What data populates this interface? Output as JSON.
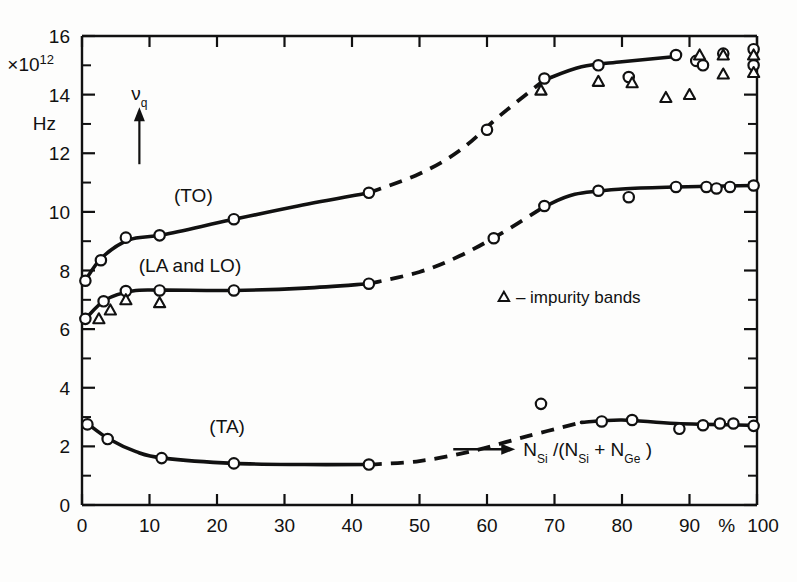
{
  "chart_data": {
    "type": "scatter",
    "title": "",
    "subtitle": "",
    "xlabel": "N_Si /(N_Si + N_Ge)",
    "xlabel_parts": {
      "arrow": "→",
      "n1": "N",
      "sub1": "Si",
      "slash": " /(",
      "n2": "N",
      "sub2": "Si",
      "plus": " + ",
      "n3": "N",
      "sub3": "Ge",
      "close": " )"
    },
    "ylabel": "Hz",
    "y_exponent_label": "×10",
    "y_exponent_sup": "12",
    "y_unit": "Hz",
    "xlim": [
      0,
      100
    ],
    "ylim": [
      0,
      16
    ],
    "x_unit": "%",
    "x_ticks": [
      0,
      10,
      20,
      30,
      40,
      50,
      60,
      70,
      80,
      90,
      100
    ],
    "x_ticklabels": [
      "0",
      "10",
      "20",
      "30",
      "40",
      "50",
      "60",
      "70",
      "80",
      "90",
      "100"
    ],
    "y_ticks": [
      0,
      2,
      4,
      6,
      8,
      10,
      12,
      14,
      16
    ],
    "y_ticklabels": [
      "0",
      "2",
      "4",
      "6",
      "8",
      "10",
      "12",
      "14",
      "16"
    ],
    "y_minor_ticks": [
      1,
      3,
      5,
      7,
      9,
      11,
      13,
      15
    ],
    "grid": false,
    "legend": [
      {
        "marker": "triangle",
        "text": "– impurity bands"
      }
    ],
    "annotations": [
      {
        "text": "ν",
        "sub": "q",
        "type": "arrow-up",
        "x": 8.5,
        "y": 13.4
      }
    ],
    "series": [
      {
        "name": "(TO)",
        "label": "(TO)",
        "label_x": 16.5,
        "label_y": 10.35,
        "marker": "circle",
        "points": [
          {
            "x": 0.5,
            "y": 7.65
          },
          {
            "x": 2.8,
            "y": 8.35
          },
          {
            "x": 6.5,
            "y": 9.12
          },
          {
            "x": 11.5,
            "y": 9.2
          },
          {
            "x": 22.5,
            "y": 9.75
          },
          {
            "x": 42.5,
            "y": 10.65
          },
          {
            "x": 60.0,
            "y": 12.8
          },
          {
            "x": 68.5,
            "y": 14.55
          },
          {
            "x": 76.5,
            "y": 15.0
          },
          {
            "x": 81.0,
            "y": 14.6
          },
          {
            "x": 88.0,
            "y": 15.35
          },
          {
            "x": 91.0,
            "y": 15.15
          },
          {
            "x": 92.0,
            "y": 15.0
          },
          {
            "x": 95.0,
            "y": 15.4
          },
          {
            "x": 99.5,
            "y": 15.55
          },
          {
            "x": 99.5,
            "y": 15.0
          }
        ],
        "curve": [
          {
            "x": 0.3,
            "y": 7.6
          },
          {
            "x": 3.0,
            "y": 8.45
          },
          {
            "x": 7.0,
            "y": 9.05
          },
          {
            "x": 12.0,
            "y": 9.22
          },
          {
            "x": 22.0,
            "y": 9.72
          },
          {
            "x": 32.0,
            "y": 10.2
          },
          {
            "x": 42.5,
            "y": 10.65
          }
        ],
        "curve_dashed": [
          {
            "x": 42.5,
            "y": 10.65
          },
          {
            "x": 50.0,
            "y": 11.3
          },
          {
            "x": 56.0,
            "y": 12.1
          },
          {
            "x": 62.0,
            "y": 13.3
          },
          {
            "x": 68.5,
            "y": 14.5
          }
        ],
        "curve_tail": [
          {
            "x": 68.5,
            "y": 14.5
          },
          {
            "x": 74.0,
            "y": 14.95
          },
          {
            "x": 80.0,
            "y": 15.12
          },
          {
            "x": 88.0,
            "y": 15.3
          }
        ]
      },
      {
        "name": "(LA and LO)",
        "label": "(LA and LO)",
        "label_x": 16.0,
        "label_y": 7.95,
        "marker": "circle",
        "points": [
          {
            "x": 0.5,
            "y": 6.35
          },
          {
            "x": 3.2,
            "y": 6.95
          },
          {
            "x": 6.5,
            "y": 7.3
          },
          {
            "x": 11.5,
            "y": 7.32
          },
          {
            "x": 22.5,
            "y": 7.32
          },
          {
            "x": 42.5,
            "y": 7.55
          },
          {
            "x": 61.0,
            "y": 9.1
          },
          {
            "x": 68.5,
            "y": 10.2
          },
          {
            "x": 76.5,
            "y": 10.72
          },
          {
            "x": 81.0,
            "y": 10.5
          },
          {
            "x": 88.0,
            "y": 10.85
          },
          {
            "x": 92.5,
            "y": 10.85
          },
          {
            "x": 94.0,
            "y": 10.8
          },
          {
            "x": 96.0,
            "y": 10.85
          },
          {
            "x": 99.5,
            "y": 10.9
          }
        ],
        "curve": [
          {
            "x": 0.5,
            "y": 6.35
          },
          {
            "x": 3.5,
            "y": 7.0
          },
          {
            "x": 7.5,
            "y": 7.3
          },
          {
            "x": 12.0,
            "y": 7.33
          },
          {
            "x": 22.5,
            "y": 7.32
          },
          {
            "x": 33.0,
            "y": 7.4
          },
          {
            "x": 42.5,
            "y": 7.55
          }
        ],
        "curve_dashed": [
          {
            "x": 42.5,
            "y": 7.55
          },
          {
            "x": 50.0,
            "y": 7.95
          },
          {
            "x": 56.0,
            "y": 8.5
          },
          {
            "x": 62.0,
            "y": 9.25
          },
          {
            "x": 68.5,
            "y": 10.18
          }
        ],
        "curve_tail": [
          {
            "x": 68.5,
            "y": 10.18
          },
          {
            "x": 73.0,
            "y": 10.6
          },
          {
            "x": 80.0,
            "y": 10.78
          },
          {
            "x": 88.0,
            "y": 10.85
          },
          {
            "x": 99.5,
            "y": 10.9
          }
        ]
      },
      {
        "name": "(TA)",
        "label": "(TA)",
        "label_x": 21.5,
        "label_y": 2.45,
        "marker": "circle",
        "points": [
          {
            "x": 0.8,
            "y": 2.75
          },
          {
            "x": 3.8,
            "y": 2.25
          },
          {
            "x": 11.8,
            "y": 1.6
          },
          {
            "x": 22.5,
            "y": 1.42
          },
          {
            "x": 42.5,
            "y": 1.38
          },
          {
            "x": 68.0,
            "y": 3.45
          },
          {
            "x": 77.0,
            "y": 2.85
          },
          {
            "x": 81.5,
            "y": 2.9
          },
          {
            "x": 88.5,
            "y": 2.6
          },
          {
            "x": 92.0,
            "y": 2.72
          },
          {
            "x": 94.5,
            "y": 2.78
          },
          {
            "x": 96.5,
            "y": 2.78
          },
          {
            "x": 99.5,
            "y": 2.7
          }
        ],
        "curve": [
          {
            "x": 0.8,
            "y": 2.78
          },
          {
            "x": 4.0,
            "y": 2.25
          },
          {
            "x": 8.0,
            "y": 1.82
          },
          {
            "x": 12.0,
            "y": 1.6
          },
          {
            "x": 22.5,
            "y": 1.42
          },
          {
            "x": 33.0,
            "y": 1.38
          },
          {
            "x": 42.5,
            "y": 1.38
          }
        ],
        "curve_dashed": [
          {
            "x": 42.5,
            "y": 1.38
          },
          {
            "x": 50.0,
            "y": 1.5
          },
          {
            "x": 58.0,
            "y": 1.85
          },
          {
            "x": 66.0,
            "y": 2.35
          },
          {
            "x": 74.0,
            "y": 2.82
          }
        ],
        "curve_tail": [
          {
            "x": 74.0,
            "y": 2.82
          },
          {
            "x": 80.0,
            "y": 2.9
          },
          {
            "x": 88.0,
            "y": 2.78
          },
          {
            "x": 99.5,
            "y": 2.72
          }
        ]
      },
      {
        "name": "impurity bands",
        "label": "",
        "marker": "triangle",
        "points": [
          {
            "x": 2.5,
            "y": 6.35
          },
          {
            "x": 4.2,
            "y": 6.65
          },
          {
            "x": 6.5,
            "y": 7.0
          },
          {
            "x": 11.5,
            "y": 6.9
          },
          {
            "x": 68.0,
            "y": 14.15
          },
          {
            "x": 76.5,
            "y": 14.45
          },
          {
            "x": 81.5,
            "y": 14.4
          },
          {
            "x": 86.5,
            "y": 13.9
          },
          {
            "x": 90.0,
            "y": 14.0
          },
          {
            "x": 91.5,
            "y": 15.35
          },
          {
            "x": 95.0,
            "y": 15.35
          },
          {
            "x": 95.0,
            "y": 14.7
          },
          {
            "x": 99.5,
            "y": 15.35
          },
          {
            "x": 99.5,
            "y": 14.75
          }
        ]
      }
    ]
  }
}
